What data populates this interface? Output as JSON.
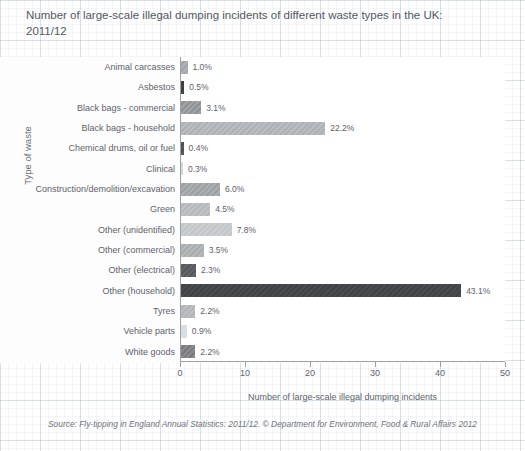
{
  "chart_data": {
    "type": "bar",
    "orientation": "horizontal",
    "title": "Number of large-scale illegal dumping incidents of different waste types in the UK: 2011/12",
    "xlabel": "Number of large-scale illegal dumping incidents",
    "ylabel": "Type of waste",
    "xlim": [
      0,
      50
    ],
    "xticks": [
      0,
      10,
      20,
      30,
      40,
      50
    ],
    "grid": false,
    "legend": null,
    "categories": [
      "Animal carcasses",
      "Asbestos",
      "Black bags - commercial",
      "Black bags - household",
      "Chemical drums, oil or fuel",
      "Clinical",
      "Construction/demolition/excavation",
      "Green",
      "Other (unidentified)",
      "Other (commercial)",
      "Other (electrical)",
      "Other (household)",
      "Tyres",
      "Vehicle parts",
      "White goods"
    ],
    "values": [
      1.0,
      0.5,
      3.1,
      22.2,
      0.4,
      0.3,
      6.0,
      4.5,
      7.8,
      3.5,
      2.3,
      43.1,
      2.2,
      0.9,
      2.2
    ],
    "data_labels": [
      "1.0%",
      "0.5%",
      "3.1%",
      "22.2%",
      "0.4%",
      "0.3%",
      "6.0%",
      "4.5%",
      "7.8%",
      "3.5%",
      "2.3%",
      "43.1%",
      "2.2%",
      "0.9%",
      "2.2%"
    ],
    "bar_colors": [
      "#a0a4a8",
      "#3a3c3f",
      "#8e9295",
      "#adb1b4",
      "#4c4e51",
      "#d2d5d7",
      "#9ba0a3",
      "#b4b8ba",
      "#c2c6c8",
      "#a8acaf",
      "#55585b",
      "#3f4245",
      "#b0b4b7",
      "#d9dcde",
      "#77797c"
    ],
    "source": "Source: Fly-tipping in England Annual Statistics: 2011/12. © Department for Environment, Food & Rural Affairs 2012"
  },
  "axis": {
    "x_tick_labels": [
      "0",
      "10",
      "20",
      "30",
      "40",
      "50"
    ]
  }
}
